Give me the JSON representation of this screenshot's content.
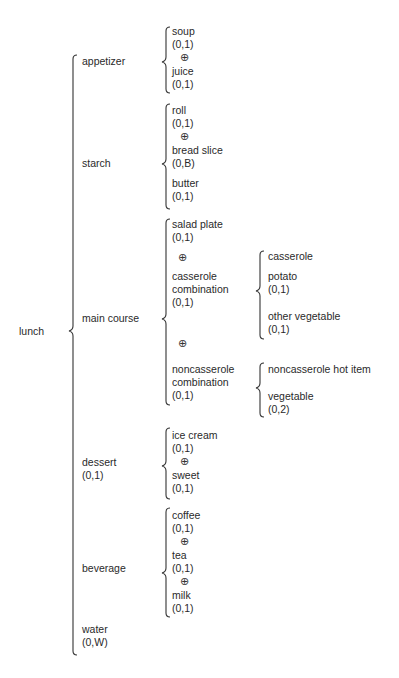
{
  "diagram": {
    "type": "warnier-orr",
    "root": "lunch",
    "xor_symbol": "⊕",
    "level1": {
      "appetizer": {
        "label": "appetizer"
      },
      "starch": {
        "label": "starch"
      },
      "main_course": {
        "label": "main course"
      },
      "dessert": {
        "label": "dessert",
        "rep": "(0,1)"
      },
      "beverage": {
        "label": "beverage"
      },
      "water": {
        "label": "water",
        "rep": "(0,W)"
      }
    },
    "appetizer": {
      "soup": {
        "label": "soup",
        "rep": "(0,1)"
      },
      "juice": {
        "label": "juice",
        "rep": "(0,1)"
      }
    },
    "starch": {
      "roll": {
        "label": "roll",
        "rep": "(0,1)"
      },
      "bread_slice": {
        "label": "bread slice",
        "rep": "(0,B)"
      },
      "butter": {
        "label": "butter",
        "rep": "(0,1)"
      }
    },
    "main_course": {
      "salad_plate": {
        "label": "salad plate",
        "rep": "(0,1)"
      },
      "casserole_combination": {
        "line1": "casserole",
        "line2": "combination",
        "rep": "(0,1)"
      },
      "noncasserole_combination": {
        "line1": "noncasserole",
        "line2": "combination",
        "rep": "(0,1)"
      }
    },
    "casserole_combination": {
      "casserole": {
        "label": "casserole"
      },
      "potato": {
        "label": "potato",
        "rep": "(0,1)"
      },
      "other_vegetable": {
        "label": "other vegetable",
        "rep": "(0,1)"
      }
    },
    "noncasserole_combination": {
      "hot_item": {
        "label": "noncasserole hot item"
      },
      "vegetable": {
        "label": "vegetable",
        "rep": "(0,2)"
      }
    },
    "dessert": {
      "ice_cream": {
        "label": "ice cream",
        "rep": "(0,1)"
      },
      "sweet": {
        "label": "sweet",
        "rep": "(0,1)"
      }
    },
    "beverage": {
      "coffee": {
        "label": "coffee",
        "rep": "(0,1)"
      },
      "tea": {
        "label": "tea",
        "rep": "(0,1)"
      },
      "milk": {
        "label": "milk",
        "rep": "(0,1)"
      }
    }
  }
}
